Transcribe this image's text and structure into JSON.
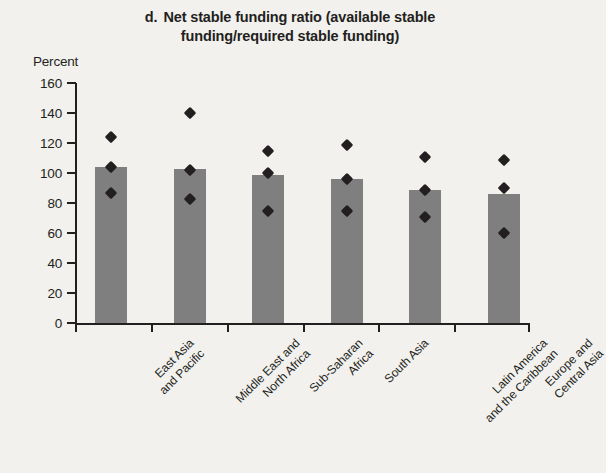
{
  "chart_data": {
    "type": "bar",
    "panel_letter": "d.",
    "title_line1": "Net stable funding ratio (available stable",
    "title_line2": "funding/required stable funding)",
    "ylabel": "Percent",
    "xlabel": "",
    "ylim": [
      0,
      160
    ],
    "yticks": [
      0,
      20,
      40,
      60,
      80,
      100,
      120,
      140,
      160
    ],
    "ytick_labels": [
      "0",
      "20",
      "40",
      "60",
      "80",
      "100",
      "120",
      "140",
      "160"
    ],
    "grid": false,
    "legend": "none",
    "categories": [
      "East Asia and Pacific",
      "Middle East and North Africa",
      "Sub-Saharan Africa",
      "South Asia",
      "Latin America and the Caribbean",
      "Europe and Central Asia"
    ],
    "category_lines": [
      [
        "East Asia",
        "and Pacific"
      ],
      [
        "Middle East and",
        "North Africa"
      ],
      [
        "Sub-Saharan",
        "Africa"
      ],
      [
        "South Asia"
      ],
      [
        "Latin America",
        "and the Caribbean"
      ],
      [
        "Europe and",
        "Central Asia"
      ]
    ],
    "series": [
      {
        "name": "Median",
        "type": "bar",
        "values": [
          104,
          103,
          99,
          96,
          89,
          86
        ]
      },
      {
        "name": "Upper value",
        "type": "scatter",
        "marker": "diamond",
        "values": [
          124,
          140,
          115,
          119,
          111,
          109
        ]
      },
      {
        "name": "Middle value",
        "type": "scatter",
        "marker": "diamond",
        "values": [
          104,
          102,
          100,
          96,
          89,
          90
        ]
      },
      {
        "name": "Lower value",
        "type": "scatter",
        "marker": "diamond",
        "values": [
          87,
          83,
          75,
          75,
          71,
          60
        ]
      }
    ],
    "colors": {
      "bar": "#7f7f7f",
      "marker": "#231f20",
      "axis": "#231f20",
      "background": "#f2f1ee"
    }
  }
}
